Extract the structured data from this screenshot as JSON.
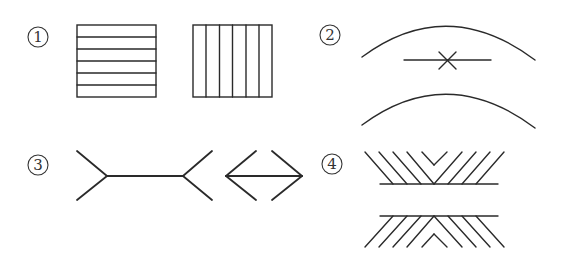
{
  "labels": {
    "fig1": "1",
    "fig2": "2",
    "fig3": "3",
    "fig4": "4"
  },
  "figures": [
    {
      "id": "1",
      "name": "horizontal-vs-vertical-striped-squares"
    },
    {
      "id": "2",
      "name": "arcs-with-crossed-line"
    },
    {
      "id": "3",
      "name": "muller-lyer-arrows"
    },
    {
      "id": "4",
      "name": "zollner-parallel-lines"
    }
  ],
  "colors": {
    "stroke": "#2a2a2a",
    "background": "#ffffff"
  }
}
